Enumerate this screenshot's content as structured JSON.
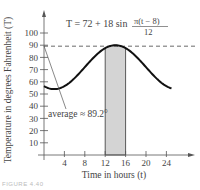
{
  "chart_data": {
    "type": "line",
    "title": "",
    "equation": {
      "lhs": "T = 72 + 18 sin",
      "numerator": "π(t − 8)",
      "denominator": "12"
    },
    "xlabel": "Time in hours (t)",
    "ylabel": "Temperature in degrees Fahrenheit (T)",
    "xlim": [
      0,
      26
    ],
    "ylim": [
      0,
      110
    ],
    "x_ticks": [
      4,
      8,
      12,
      16,
      20,
      24
    ],
    "y_ticks": [
      10,
      20,
      30,
      40,
      50,
      60,
      70,
      80,
      90,
      100
    ],
    "grid": false,
    "series": [
      {
        "name": "T(t) = 72 + 18 sin(π(t−8)/12)",
        "x": [
          0,
          2,
          4,
          6,
          8,
          10,
          12,
          14,
          16,
          18,
          20,
          22,
          24
        ],
        "values": [
          56.4,
          54.0,
          56.4,
          63.0,
          72.0,
          81.0,
          87.6,
          90.0,
          87.6,
          81.0,
          72.0,
          63.0,
          56.4
        ]
      }
    ],
    "shaded_region": {
      "x_from": 12,
      "x_to": 16
    },
    "reference_line": {
      "y": 89.2,
      "style": "dashed"
    },
    "annotations": [
      {
        "text": "average ≈ 89.2°",
        "points_to": {
          "x": 0,
          "y": 89.2
        }
      }
    ]
  },
  "figure": {
    "caption": "FIGURE 4.40"
  }
}
